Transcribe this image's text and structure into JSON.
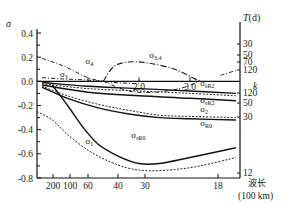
{
  "chart_data": {
    "type": "line",
    "title": "",
    "ylabel": "σ",
    "ylim": [
      -0.8,
      0.4
    ],
    "yticks": [
      "0.4",
      "0.2",
      "0.0",
      "-0.2",
      "-0.4",
      "-0.6",
      "-0.8"
    ],
    "ytick_values": [
      0.4,
      0.2,
      0.0,
      -0.2,
      -0.4,
      -0.6,
      -0.8
    ],
    "k_axis": {
      "label": "k",
      "ticks": [
        "1",
        "2.0",
        "3.0"
      ],
      "tick_values": [
        1,
        2,
        3
      ],
      "range": [
        0,
        4
      ]
    },
    "bottom_axis": {
      "label": "波长",
      "unit": "(100 km)",
      "ticks": [
        "200",
        "100",
        "60",
        "40",
        "30",
        "18"
      ],
      "tick_k_positions": [
        0.2,
        0.4,
        0.67,
        1.0,
        1.33,
        2.22
      ]
    },
    "right_axis": {
      "label": "T(d)",
      "upper_ticks": [
        "30",
        "50",
        "70",
        "120"
      ],
      "upper_tick_values": [
        0.26,
        0.15,
        0.1,
        0.055
      ],
      "lower_ticks": [
        "120",
        "50",
        "30",
        "12"
      ],
      "lower_tick_values": [
        -0.07,
        -0.15,
        -0.24,
        -0.78
      ]
    },
    "series": [
      {
        "name": "σ4",
        "label": "σ",
        "sub": "4",
        "style": "dash-dot",
        "x": [
          0.1,
          0.5,
          1.0,
          1.3
        ],
        "y": [
          0.19,
          0.13,
          0.03,
          0.0
        ]
      },
      {
        "name": "σ3",
        "label": "σ",
        "sub": "3",
        "style": "dash-dot",
        "x": [
          0.1,
          0.5,
          1.0,
          1.5,
          2.0
        ],
        "y": [
          0.03,
          0.02,
          0.01,
          -0.01,
          -0.02
        ]
      },
      {
        "name": "σ3,4",
        "label": "σ",
        "sub": "(3,4)",
        "style": "dash-dot-loop",
        "x": [
          1.3,
          1.5,
          1.8,
          2.2,
          2.7,
          3.1,
          3.2
        ],
        "y": [
          0.0,
          0.12,
          0.16,
          0.15,
          0.1,
          0.02,
          0.0
        ]
      },
      {
        "name": "σ3,4 lower branch",
        "label": "",
        "sub": "",
        "style": "dash-dot",
        "x": [
          1.3,
          1.8,
          2.3,
          2.8,
          3.2
        ],
        "y": [
          0.0,
          -0.08,
          -0.09,
          -0.06,
          0.0
        ]
      },
      {
        "name": "σ3,4 right",
        "label": "",
        "sub": "",
        "style": "dash-dot",
        "x": [
          3.6,
          3.9
        ],
        "y": [
          0.05,
          0.09
        ]
      },
      {
        "name": "σsR2 upper",
        "label": "σ",
        "sub": "sR2",
        "style": "solid",
        "x": [
          0.1,
          1.0,
          2.0,
          3.0,
          3.9
        ],
        "y": [
          -0.01,
          -0.04,
          -0.06,
          -0.08,
          -0.1
        ]
      },
      {
        "name": "σR2 dotted",
        "label": "",
        "sub": "",
        "style": "dotted",
        "x": [
          0.1,
          1.0,
          2.0,
          3.0,
          3.9
        ],
        "y": [
          -0.02,
          -0.06,
          -0.08,
          -0.1,
          -0.12
        ]
      },
      {
        "name": "σsR2",
        "label": "σ",
        "sub": "sR2",
        "style": "solid",
        "x": [
          0.1,
          1.0,
          2.0,
          3.0,
          3.9
        ],
        "y": [
          -0.03,
          -0.09,
          -0.12,
          -0.14,
          -0.16
        ]
      },
      {
        "name": "σ2",
        "label": "σ",
        "sub": "2",
        "style": "dotted",
        "x": [
          0.1,
          0.6,
          1.2,
          1.8,
          2.4,
          3.0,
          3.9
        ],
        "y": [
          -0.04,
          -0.12,
          -0.19,
          -0.24,
          -0.28,
          -0.29,
          -0.3
        ]
      },
      {
        "name": "σR0",
        "label": "σ",
        "sub": "R0",
        "style": "solid",
        "x": [
          0.1,
          0.6,
          1.2,
          1.8,
          2.4,
          3.0,
          3.9
        ],
        "y": [
          -0.05,
          -0.14,
          -0.22,
          -0.27,
          -0.3,
          -0.31,
          -0.32
        ]
      },
      {
        "name": "σsR0",
        "label": "σ",
        "sub": "sR0",
        "style": "solid",
        "x": [
          0.3,
          0.6,
          0.9,
          1.2,
          1.6,
          2.0,
          2.4,
          3.0,
          3.9
        ],
        "y": [
          -0.03,
          -0.2,
          -0.38,
          -0.52,
          -0.62,
          -0.68,
          -0.68,
          -0.63,
          -0.55
        ]
      },
      {
        "name": "σ1",
        "label": "σ",
        "sub": "1",
        "style": "dotted",
        "x": [
          0.0,
          0.3,
          0.6,
          1.0,
          1.4,
          1.8,
          2.2,
          2.7,
          3.2,
          3.9
        ],
        "y": [
          -0.25,
          -0.32,
          -0.44,
          -0.57,
          -0.66,
          -0.72,
          -0.74,
          -0.73,
          -0.7,
          -0.63
        ]
      }
    ],
    "annotations": [
      {
        "text": "σ",
        "sub": "4",
        "at": [
          0.95,
          0.14
        ]
      },
      {
        "text": "σ",
        "sub": "3",
        "at": [
          0.45,
          0.04
        ]
      },
      {
        "text": "σ",
        "sub": "(3,4)",
        "at": [
          2.2,
          0.19
        ]
      },
      {
        "text": "σ",
        "sub": "sR2",
        "at": [
          3.2,
          -0.04
        ]
      },
      {
        "text": "σ",
        "sub": "sR2",
        "at": [
          3.2,
          -0.18
        ]
      },
      {
        "text": "σ",
        "sub": "2",
        "at": [
          3.2,
          -0.25
        ]
      },
      {
        "text": "σ",
        "sub": "R0",
        "at": [
          3.2,
          -0.37
        ]
      },
      {
        "text": "σ",
        "sub": "sR0",
        "at": [
          1.85,
          -0.47
        ]
      },
      {
        "text": "σ",
        "sub": "1",
        "at": [
          0.95,
          -0.52
        ]
      }
    ],
    "grid": false,
    "legend": "none"
  }
}
